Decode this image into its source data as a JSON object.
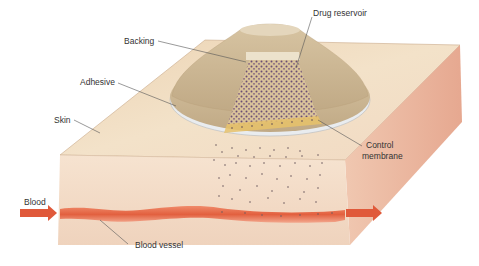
{
  "figure": {
    "labels": {
      "drug_reservoir": "Drug reservoir",
      "backing": "Backing",
      "adhesive": "Adhesive",
      "skin": "Skin",
      "control_membrane_line1": "Control",
      "control_membrane_line2": "membrane",
      "blood": "Blood",
      "blood_vessel": "Blood vessel"
    },
    "colors": {
      "skin_top": "#f1dcc0",
      "skin_front": "#f3dcc6",
      "skin_side": "#eab7a0",
      "patch_tan": "#cbb591",
      "patch_light": "#e6d7bb",
      "adhesive_rim": "#e9ecef",
      "drug_dots": "#6a4d72",
      "membrane_yellow": "#e8c26a",
      "blood_vessel": "#e26a4b",
      "arrow": "#e0593a",
      "leader_line": "#555555"
    }
  }
}
